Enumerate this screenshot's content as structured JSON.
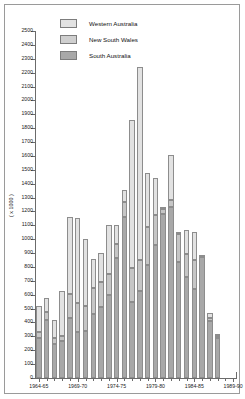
{
  "chart_data": {
    "type": "bar",
    "subtype": "stacked-vertical",
    "title": "",
    "xlabel": "",
    "ylabel": "( x 1000 )",
    "ylim": [
      0,
      2500
    ],
    "ytick_step": 100,
    "ytick_labels": [
      "0",
      "100",
      "200",
      "300",
      "400",
      "500",
      "600",
      "700",
      "800",
      "900",
      "1000",
      "1100",
      "1200",
      "1300",
      "1400",
      "1500",
      "1600",
      "1700",
      "1800",
      "1900",
      "2000",
      "2100",
      "2200",
      "2300",
      "2400",
      "2500"
    ],
    "grid": false,
    "legend_position": "top-left",
    "categories": [
      "1964-65",
      "1965-66",
      "1966-67",
      "1967-68",
      "1968-69",
      "1969-70",
      "1970-71",
      "1971-72",
      "1972-73",
      "1973-74",
      "1974-75",
      "1975-76",
      "1976-77",
      "1977-78",
      "1978-79",
      "1979-80",
      "1980-81",
      "1981-82",
      "1982-83",
      "1983-84",
      "1984-85",
      "1985-86",
      "1986-87",
      "1987-88",
      "1988-89",
      "1989-90"
    ],
    "xtick_labels": [
      "1964-65",
      "1969-70",
      "1974-75",
      "1979-80",
      "1984-85",
      "1989-90"
    ],
    "xtick_label_indices": [
      0,
      5,
      10,
      15,
      20,
      25
    ],
    "series": [
      {
        "name": "South Australia",
        "color": "#a8a8a8",
        "values": [
          290,
          420,
          245,
          265,
          430,
          335,
          340,
          460,
          510,
          595,
          865,
          1160,
          545,
          630,
          815,
          960,
          1180,
          1230,
          835,
          725,
          640,
          870,
          410,
          285,
          0,
          0
        ]
      },
      {
        "name": "New South Wales",
        "color": "#c6c6c6",
        "values": [
          45,
          55,
          40,
          40,
          175,
          205,
          180,
          190,
          185,
          155,
          100,
          105,
          245,
          220,
          270,
          215,
          35,
          55,
          200,
          165,
          210,
          5,
          25,
          15,
          0,
          0
        ]
      },
      {
        "name": "Western Australia",
        "color": "#e2e2e2",
        "values": [
          185,
          100,
          130,
          320,
          555,
          610,
          480,
          205,
          205,
          350,
          140,
          90,
          1070,
          1390,
          390,
          265,
          10,
          325,
          10,
          180,
          200,
          0,
          30,
          20,
          0,
          0
        ]
      }
    ],
    "totals": [
      520,
      575,
      415,
      625,
      1160,
      1150,
      1000,
      855,
      900,
      1100,
      1105,
      1355,
      1860,
      2240,
      1475,
      1440,
      1225,
      1610,
      1045,
      1070,
      1050,
      875,
      465,
      320,
      0,
      0
    ]
  },
  "legend": {
    "items": [
      {
        "label": "Western Australia",
        "key": "wa"
      },
      {
        "label": "New South Wales",
        "key": "nsw"
      },
      {
        "label": "South Australia",
        "key": "sa"
      }
    ]
  }
}
